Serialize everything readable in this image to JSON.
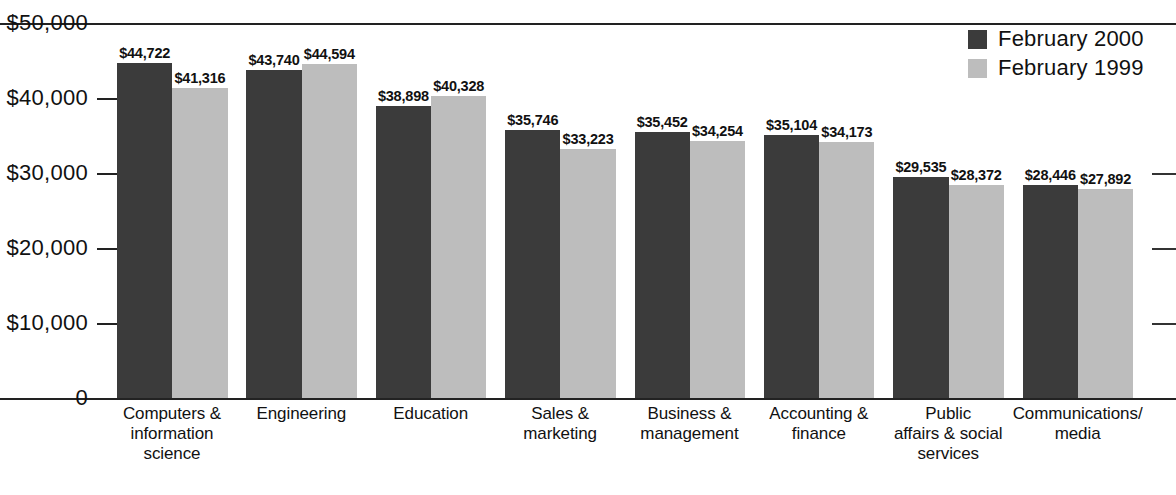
{
  "chart_data": {
    "type": "bar",
    "title": "",
    "subtitle": "",
    "xlabel": "",
    "ylabel": "",
    "ylim": [
      0,
      50000
    ],
    "grid": false,
    "legend_position": "top-right",
    "categories": [
      "Computers &\ninformation\nscience",
      "Engineering",
      "Education",
      "Sales &\nmarketing",
      "Business &\nmanagement",
      "Accounting &\nfinance",
      "Public\naffairs & social\nservices",
      "Communications/\nmedia"
    ],
    "ytick_labels": [
      "$50,000",
      "$40,000",
      "$30,000",
      "$20,000",
      "$10,000",
      "0"
    ],
    "ytick_values": [
      50000,
      40000,
      30000,
      20000,
      10000,
      0
    ],
    "series": [
      {
        "name": "February 2000",
        "color": "#3b3b3b",
        "values": [
          44722,
          43740,
          38898,
          35746,
          35452,
          35104,
          29535,
          28446
        ],
        "labels": [
          "$44,722",
          "$43,740",
          "$38,898",
          "$35,746",
          "$35,452",
          "$35,104",
          "$29,535",
          "$28,446"
        ]
      },
      {
        "name": "February 1999",
        "color": "#bdbdbd",
        "values": [
          41316,
          44594,
          40328,
          33223,
          34254,
          34173,
          28372,
          27892
        ],
        "labels": [
          "$41,316",
          "$44,594",
          "$40,328",
          "$33,223",
          "$34,254",
          "$34,173",
          "$28,372",
          "$27,892"
        ]
      }
    ]
  },
  "legend": {
    "items": [
      {
        "label": "February 2000",
        "color": "#3b3b3b"
      },
      {
        "label": "February 1999",
        "color": "#bdbdbd"
      }
    ]
  }
}
